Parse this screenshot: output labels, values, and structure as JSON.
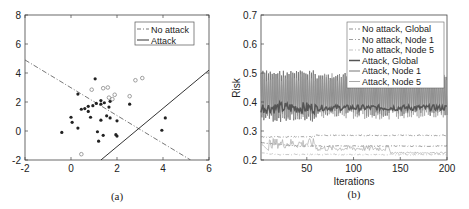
{
  "chart_data": [
    {
      "type": "scatter",
      "caption": "(a)",
      "xlim": [
        -2,
        6
      ],
      "ylim": [
        -2,
        8
      ],
      "xticks": [
        -2,
        0,
        2,
        4,
        6
      ],
      "yticks": [
        -2,
        0,
        2,
        4,
        6,
        8
      ],
      "grid": false,
      "legend_position": "upper right",
      "legend": [
        "No attack",
        "Attack"
      ],
      "lines": [
        {
          "name": "No attack",
          "style": "dash-dot",
          "points": [
            [
              -2,
              4.9
            ],
            [
              5.2,
              -2
            ]
          ]
        },
        {
          "name": "Attack",
          "style": "solid",
          "points": [
            [
              1.3,
              -2
            ],
            [
              6,
              4.2
            ]
          ]
        }
      ],
      "series": [
        {
          "name": "class 1 (filled)",
          "marker": "filled",
          "points": [
            [
              1.05,
              3.6
            ],
            [
              0.3,
              2.55
            ],
            [
              1.3,
              2.1
            ],
            [
              1.7,
              2.05
            ],
            [
              1.45,
              1.95
            ],
            [
              1.1,
              1.9
            ],
            [
              1.3,
              1.85
            ],
            [
              2.55,
              1.85
            ],
            [
              0.45,
              1.5
            ],
            [
              0.6,
              1.55
            ],
            [
              0.75,
              1.7
            ],
            [
              0.95,
              1.75
            ],
            [
              1.65,
              1.65
            ],
            [
              0.75,
              1.35
            ],
            [
              1.55,
              1.05
            ],
            [
              0.0,
              0.95
            ],
            [
              0.85,
              0.95
            ],
            [
              1.7,
              0.9
            ],
            [
              4.1,
              0.9
            ],
            [
              1.3,
              0.75
            ],
            [
              2.0,
              0.7
            ],
            [
              0.05,
              0.6
            ],
            [
              0.3,
              0.2
            ],
            [
              -0.4,
              -0.1
            ],
            [
              1.15,
              -0.05
            ],
            [
              3.95,
              0.05
            ],
            [
              1.95,
              -0.25
            ],
            [
              1.4,
              -0.3
            ],
            [
              2.0,
              -0.35
            ],
            [
              1.2,
              -0.7
            ]
          ]
        },
        {
          "name": "class 2 (open)",
          "marker": "open",
          "points": [
            [
              3.1,
              3.65
            ],
            [
              2.8,
              3.5
            ],
            [
              1.6,
              3.0
            ],
            [
              1.4,
              2.95
            ],
            [
              0.9,
              2.85
            ],
            [
              1.9,
              2.5
            ],
            [
              2.55,
              2.4
            ],
            [
              1.65,
              2.3
            ],
            [
              1.8,
              2.2
            ],
            [
              0.45,
              -1.6
            ]
          ]
        }
      ]
    },
    {
      "type": "line",
      "caption": "(b)",
      "xlabel": "Iterations",
      "ylabel": "Risk",
      "xlim": [
        1,
        200
      ],
      "ylim": [
        0.2,
        0.7
      ],
      "xticks": [
        50,
        100,
        150,
        200
      ],
      "yticks": [
        0.2,
        0.3,
        0.4,
        0.5,
        0.6,
        0.7
      ],
      "grid": false,
      "legend_position": "upper right",
      "legend": [
        "No attack, Global",
        "No attack, Node 1",
        "No attack, Node 5",
        "Attack, Global",
        "Attack, Node 1",
        "Attack, Node 5"
      ],
      "series": [
        {
          "name": "No attack, Global",
          "style": "dash-dot",
          "summary": "starts ~0.26, settles ~0.25",
          "start": 0.26,
          "end": 0.25
        },
        {
          "name": "No attack, Node 1",
          "style": "dash-dot",
          "summary": "~0.28 early, rises to ~0.285 after iter 60",
          "start": 0.28,
          "end": 0.285
        },
        {
          "name": "No attack, Node 5",
          "style": "dash-dot light",
          "summary": "starts ~0.23, ~0.22 steady, ~0.22 end",
          "start": 0.23,
          "end": 0.22
        },
        {
          "name": "Attack, Global",
          "style": "solid thick",
          "summary": "oscillates around ~0.38, narrow band 0.36-0.40",
          "mean": 0.38
        },
        {
          "name": "Attack, Node 1",
          "style": "solid",
          "summary": "oscillates between ~0.33 and ~0.51",
          "min": 0.33,
          "max": 0.51
        },
        {
          "name": "Attack, Node 5",
          "style": "solid light",
          "summary": "noisy ~0.24-0.28 early (to iter ~60), then ~0.23-0.25 until ~140",
          "start": 0.26,
          "end": 0.24
        }
      ]
    }
  ]
}
